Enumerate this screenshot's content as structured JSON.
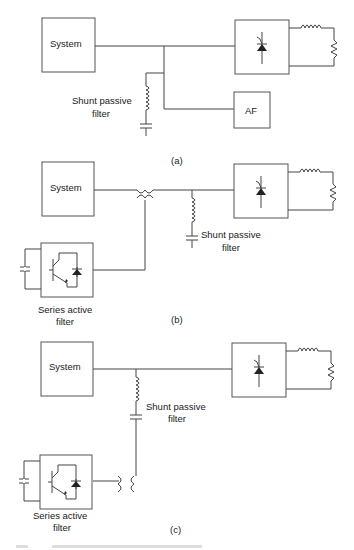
{
  "diagrams": [
    {
      "id": "a",
      "label": "(a)",
      "system_label": "System",
      "shunt_label_line1": "Shunt passive",
      "shunt_label_line2": "filter",
      "af_label": "AF"
    },
    {
      "id": "b",
      "label": "(b)",
      "system_label": "System",
      "shunt_label_line1": "Shunt passive",
      "shunt_label_line2": "filter",
      "series_label_line1": "Series active",
      "series_label_line2": "filter"
    },
    {
      "id": "c",
      "label": "(c)",
      "system_label": "System",
      "shunt_label_line1": "Shunt passive",
      "shunt_label_line2": "filter",
      "series_label_line1": "Series active",
      "series_label_line2": "filter"
    }
  ],
  "colors": {
    "line": "#444444",
    "background": "#ffffff"
  }
}
